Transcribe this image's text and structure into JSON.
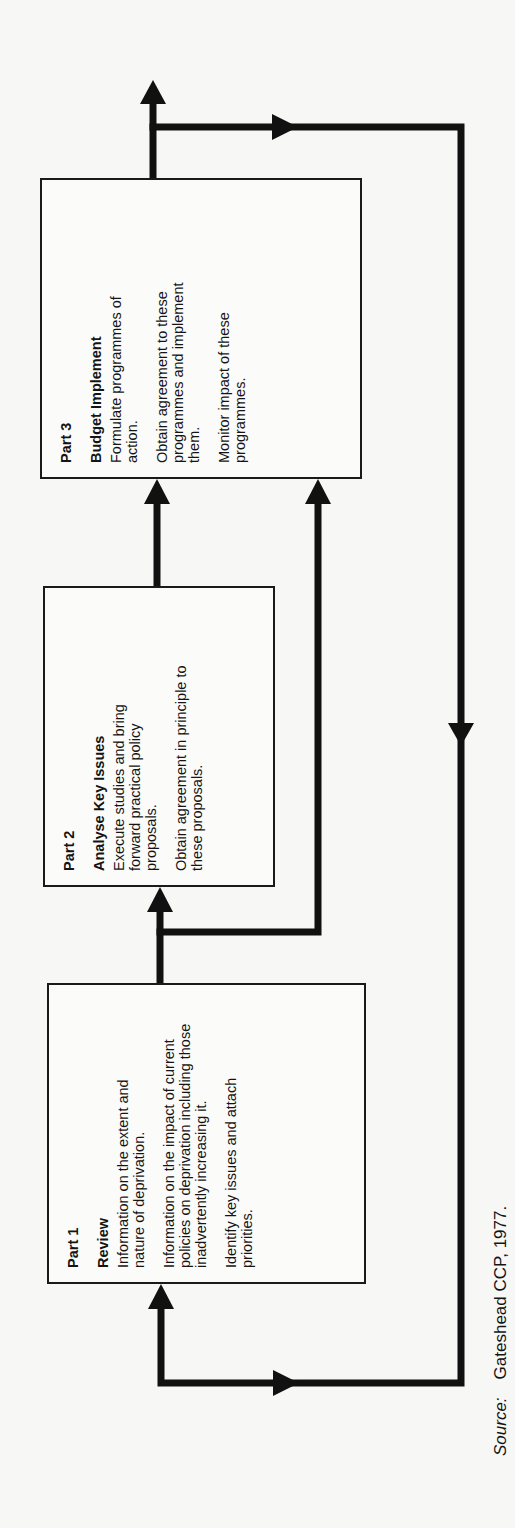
{
  "diagram": {
    "orientation": "rotated -90deg (text reads bottom to top)",
    "parts": [
      {
        "part_label": "Part 1",
        "title": "Review",
        "paragraphs": [
          "Information on the extent and nature of deprivation.",
          "Information on the impact of current policies on deprivation including those inadvertently increasing it.",
          "Identify key issues and attach priorities."
        ]
      },
      {
        "part_label": "Part 2",
        "title": "Analyse Key Issues",
        "paragraphs": [
          "Execute studies and bring forward practical policy proposals.",
          "Obtain agreement in principle to these proposals."
        ]
      },
      {
        "part_label": "Part 3",
        "title": "Budget Implement",
        "paragraphs": [
          "Formulate programmes of action.",
          "Obtain agreement to these programmes and implement them.",
          "Monitor impact of these programmes."
        ]
      }
    ],
    "flows": [
      {
        "from": "Part 1",
        "to": "Part 2"
      },
      {
        "from": "Part 1",
        "to": "Part 3"
      },
      {
        "from": "Part 2",
        "to": "Part 3"
      },
      {
        "from": "Part 3",
        "to": "output"
      },
      {
        "from": "Part 3",
        "to": "Part 1",
        "type": "feedback loop"
      }
    ],
    "colors": {
      "line": "#111111",
      "box_border": "#1a1a1a",
      "background": "#f7f7f5"
    }
  },
  "source": {
    "label": "Source:",
    "text": "Gateshead CCP, 1977."
  }
}
